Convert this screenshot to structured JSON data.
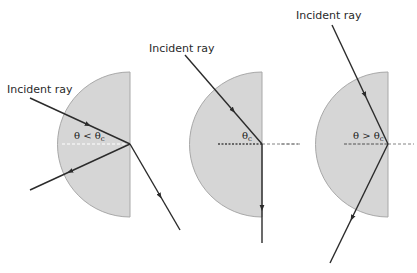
{
  "diagram": {
    "colors": {
      "block_fill": "#d6d6d6",
      "block_stroke": "#a8a8a8",
      "ray": "#2b2b2b",
      "normal": "#555555"
    },
    "panels": [
      {
        "id": "less-than-critical",
        "incident_label": "Incident ray",
        "angle_symbol": "θ < θ",
        "angle_subscript": "c",
        "description": "Partial reflection and refraction out of the block"
      },
      {
        "id": "at-critical",
        "incident_label": "Incident ray",
        "angle_symbol": "θ",
        "angle_subscript": "c",
        "description": "Refracted ray travels along the boundary"
      },
      {
        "id": "greater-than-critical",
        "incident_label": "Incident ray",
        "angle_symbol": "θ > θ",
        "angle_subscript": "c",
        "description": "Total internal reflection"
      }
    ]
  }
}
